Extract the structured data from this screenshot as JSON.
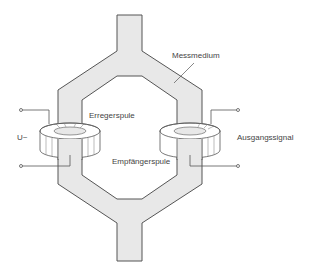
{
  "diagram": {
    "type": "flow-measurement-schematic",
    "labels": {
      "medium": "Messmedium",
      "excitation_coil": "Erregerspule",
      "receiver_coil": "Empfängerspule",
      "input_voltage": "U~",
      "output_signal": "Ausgangssignal"
    },
    "colors": {
      "pipe_fill": "#e8e8e8",
      "stroke": "#555555",
      "text": "#444444",
      "coil_fill": "#ffffff"
    },
    "components": [
      {
        "id": "pipe",
        "label_ref": "medium"
      },
      {
        "id": "coil-left",
        "label_ref": "excitation_coil"
      },
      {
        "id": "coil-right",
        "label_ref": "receiver_coil"
      },
      {
        "id": "terminals-left",
        "label_ref": "input_voltage"
      },
      {
        "id": "terminals-right",
        "label_ref": "output_signal"
      }
    ]
  }
}
